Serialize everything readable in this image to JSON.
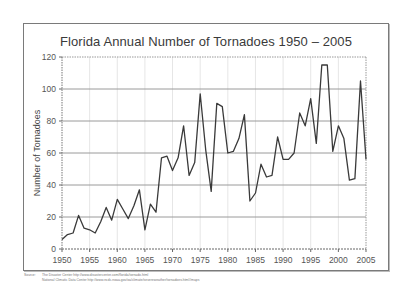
{
  "chart_data": {
    "type": "line",
    "title": "Florida Annual Number of Tornadoes 1950 – 2005",
    "xlabel": "",
    "ylabel": "Number of Tornadoes",
    "ylim": [
      0,
      120
    ],
    "xlim": [
      1950,
      2005
    ],
    "yticks": [
      0,
      20,
      40,
      60,
      80,
      100,
      120
    ],
    "xticks": [
      1950,
      1955,
      1960,
      1965,
      1970,
      1975,
      1980,
      1985,
      1990,
      1995,
      2000,
      2005
    ],
    "grid": true,
    "legend": null,
    "x": [
      1950,
      1951,
      1952,
      1953,
      1954,
      1955,
      1956,
      1957,
      1958,
      1959,
      1960,
      1961,
      1962,
      1963,
      1964,
      1965,
      1966,
      1967,
      1968,
      1969,
      1970,
      1971,
      1972,
      1973,
      1974,
      1975,
      1976,
      1977,
      1978,
      1979,
      1980,
      1981,
      1982,
      1983,
      1984,
      1985,
      1986,
      1987,
      1988,
      1989,
      1990,
      1991,
      1992,
      1993,
      1994,
      1995,
      1996,
      1997,
      1998,
      1999,
      2000,
      2001,
      2002,
      2003,
      2004,
      2005
    ],
    "series": [
      {
        "name": "Number of Tornadoes",
        "color": "#3a3a3a",
        "values": [
          6,
          9,
          10,
          21,
          13,
          12,
          10,
          17,
          26,
          18,
          31,
          25,
          19,
          27,
          37,
          12,
          28,
          23,
          57,
          58,
          49,
          57,
          77,
          46,
          54,
          97,
          62,
          36,
          91,
          89,
          60,
          61,
          69,
          84,
          30,
          35,
          53,
          45,
          46,
          70,
          56,
          56,
          60,
          85,
          77,
          94,
          66,
          115,
          115,
          61,
          77,
          69,
          43,
          44,
          105,
          56
        ]
      }
    ]
  },
  "source": {
    "label": "Source:",
    "line1": "The Disaster Center http://www.disastercenter.com/florida/tornado.html",
    "line2": "National Climatic Data Center http://www.ncdc.noaa.gov/oa/climate/severeweather/tornadoes.html#maps"
  }
}
